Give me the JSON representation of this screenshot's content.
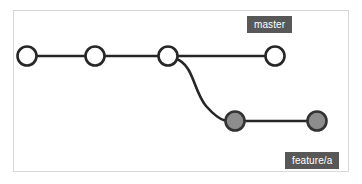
{
  "figure": {
    "background_color": "#ffffff",
    "frame": {
      "border_color": "#d8d8d8",
      "x": 13,
      "y": 10,
      "width": 336,
      "height": 162
    }
  },
  "colors": {
    "edge": "#262626",
    "master_node_fill": "#ffffff",
    "master_node_stroke": "#262626",
    "feature_node_fill": "#8d8d8d",
    "feature_node_stroke": "#333333",
    "badge_background": "#585858",
    "badge_text": "#ffffff"
  },
  "branches": [
    {
      "name": "master",
      "label": "master",
      "label_position": {
        "x": 247,
        "y": 16
      },
      "node_style": "hollow",
      "commits": [
        {
          "id": "c1",
          "cx": 27,
          "cy": 56,
          "r": 9.5
        },
        {
          "id": "c2",
          "cx": 95,
          "cy": 56,
          "r": 9.5
        },
        {
          "id": "c3",
          "cx": 168,
          "cy": 56,
          "r": 9.5
        },
        {
          "id": "c4",
          "cx": 275,
          "cy": 56,
          "r": 9.5
        }
      ]
    },
    {
      "name": "feature/a",
      "label": "feature/a",
      "label_position": {
        "x": 285,
        "y": 152
      },
      "node_style": "filled",
      "commits": [
        {
          "id": "f1",
          "cx": 235,
          "cy": 121,
          "r": 9.5
        },
        {
          "id": "f2",
          "cx": 317,
          "cy": 121,
          "r": 9.5
        }
      ]
    }
  ],
  "edges": [
    {
      "id": "edge-c1-c2",
      "from": "c1",
      "to": "c2",
      "type": "straight",
      "path": "M 36.5 56 L 85.5 56"
    },
    {
      "id": "edge-c2-c3",
      "from": "c2",
      "to": "c3",
      "type": "straight",
      "path": "M 104.5 56 L 158.5 56"
    },
    {
      "id": "edge-c3-c4",
      "from": "c3",
      "to": "c4",
      "type": "straight",
      "path": "M 177.5 56 L 265.5 56"
    },
    {
      "id": "edge-c3-f1",
      "from": "c3",
      "to": "f1",
      "type": "curve",
      "path": "M 176 58 C 196 66 194 92 207 107 C 214 115 219 119 225.5 121"
    },
    {
      "id": "edge-f1-f2",
      "from": "f1",
      "to": "f2",
      "type": "straight",
      "path": "M 244.5 121 L 307.5 121"
    }
  ],
  "labels": {
    "master": "master",
    "feature": "feature/a"
  }
}
